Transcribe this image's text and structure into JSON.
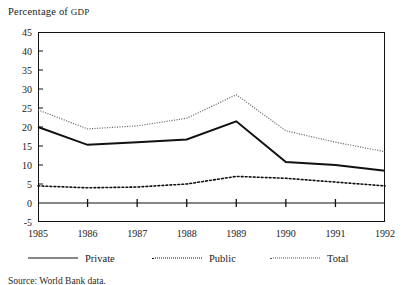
{
  "chart_data": {
    "type": "line",
    "title": "Percentage of GDP",
    "xlabel": "",
    "ylabel": "Percentage of GDP",
    "grid": false,
    "legend_position": "bottom",
    "categories": [
      "1985",
      "1986",
      "1987",
      "1988",
      "1989",
      "1990",
      "1991",
      "1992"
    ],
    "x": [
      1985,
      1986,
      1987,
      1988,
      1989,
      1990,
      1991,
      1992
    ],
    "xlim": [
      1985,
      1992
    ],
    "ylim": [
      -5,
      45
    ],
    "yticks": [
      -5,
      0,
      5,
      10,
      15,
      20,
      25,
      30,
      35,
      40,
      45
    ],
    "series": [
      {
        "name": "Private",
        "style": "solid",
        "values": [
          20.0,
          15.3,
          16.0,
          16.7,
          21.5,
          10.8,
          10.0,
          8.5
        ]
      },
      {
        "name": "Public",
        "style": "dotted",
        "values": [
          4.5,
          4.0,
          4.2,
          5.0,
          7.0,
          6.5,
          5.5,
          4.5
        ]
      },
      {
        "name": "Total",
        "style": "fine-dotted",
        "values": [
          24.5,
          19.5,
          20.3,
          22.3,
          28.5,
          19.0,
          16.0,
          13.5
        ]
      }
    ],
    "colors": {
      "private": "#111111",
      "public": "#111111",
      "total": "#6a6a6a",
      "frame": "#111111",
      "background": "#ffffff"
    }
  },
  "legend": {
    "entries": [
      {
        "label": "Private",
        "swatch": "solid-line-swatch"
      },
      {
        "label": "Public",
        "swatch": "dotted-line-swatch"
      },
      {
        "label": "Total",
        "swatch": "fine-dotted-line-swatch"
      }
    ]
  },
  "axes": {
    "y_title_main": "Percentage of ",
    "y_title_abbr": "GDP",
    "y_tick_labels": [
      "45",
      "40",
      "35",
      "30",
      "25",
      "20",
      "15",
      "10",
      "5",
      "0",
      "-5"
    ],
    "x_tick_labels": [
      "1985",
      "1986",
      "1987",
      "1988",
      "1989",
      "1990",
      "1991",
      "1992"
    ]
  },
  "footer": {
    "source_note": "Source:   World Bank data."
  }
}
